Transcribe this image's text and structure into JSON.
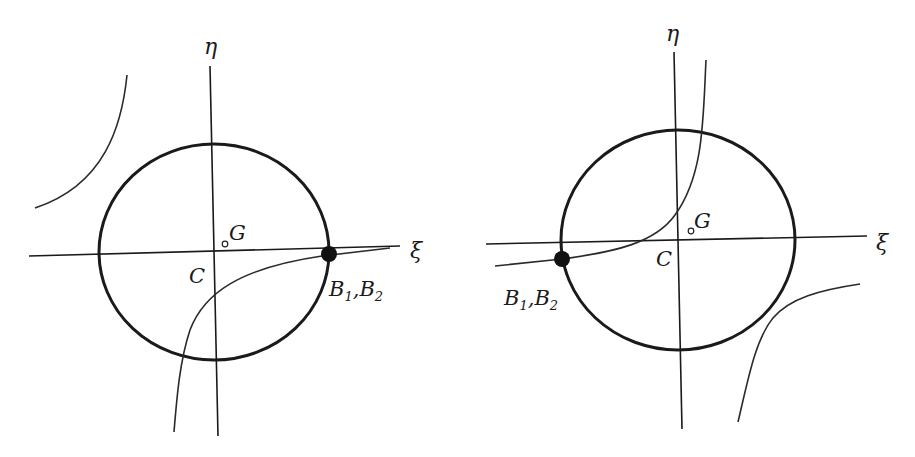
{
  "figure": {
    "panels": [
      {
        "id": "left",
        "axes": {
          "horizontal_label": "ξ",
          "vertical_label": "η"
        },
        "points": {
          "center_label": "C",
          "centroid_label": "G",
          "coincident_label_1": "B",
          "coincident_sub_1": "1",
          "separator": ",",
          "coincident_label_2": "B",
          "coincident_sub_2": "2"
        },
        "coincident_point_position": "right intersection of ellipse and ξ-axis"
      },
      {
        "id": "right",
        "axes": {
          "horizontal_label": "ξ",
          "vertical_label": "η"
        },
        "points": {
          "center_label": "C",
          "centroid_label": "G",
          "coincident_label_1": "B",
          "coincident_sub_1": "1",
          "separator": ",",
          "coincident_label_2": "B",
          "coincident_sub_2": "2"
        },
        "coincident_point_position": "left side of ellipse, slightly below ξ-axis"
      }
    ],
    "colors": {
      "ink": "#1a1a1a",
      "background": "#ffffff"
    }
  }
}
